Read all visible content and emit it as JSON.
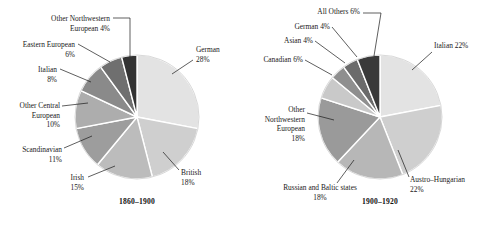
{
  "figure": {
    "type": "pie-pair",
    "background": "#ffffff"
  },
  "chart_data": [
    {
      "type": "pie",
      "title": "1860–1900",
      "caption": "1860–1900",
      "center": [
        137,
        117
      ],
      "radius": 62,
      "start_angle_deg": 0,
      "direction": "clockwise",
      "categories": [
        "German",
        "British",
        "Irish",
        "Scandinavian",
        "Other Central European",
        "Italian",
        "Eastern European",
        "Other Northwestern European"
      ],
      "values": [
        28,
        18,
        15,
        11,
        10,
        8,
        6,
        4
      ],
      "unit": "%",
      "colors": [
        "#e3e3e3",
        "#cfcfcf",
        "#bcbcbc",
        "#9d9d9d",
        "#adadad",
        "#8a8a8a",
        "#6f6f6f",
        "#333333"
      ],
      "slices": [
        {
          "label": "German",
          "value": 28,
          "value_text": "28%",
          "color": "#e3e3e3",
          "label_lines": [
            "German",
            "28%"
          ],
          "label_anchor": "start",
          "label_x": 196,
          "label_y": 52,
          "leader": [
            [
              193,
              60
            ],
            [
              172,
              74
            ]
          ]
        },
        {
          "label": "British",
          "value": 18,
          "value_text": "18%",
          "color": "#cfcfcf",
          "label_lines": [
            "British",
            "18%"
          ],
          "label_anchor": "start",
          "label_x": 181,
          "label_y": 175,
          "leader": [
            [
              179,
              170
            ],
            [
              163,
              152
            ]
          ]
        },
        {
          "label": "Irish",
          "value": 15,
          "value_text": "15%",
          "color": "#bcbcbc",
          "label_lines": [
            "Irish",
            "15%"
          ],
          "label_anchor": "end",
          "label_x": 84,
          "label_y": 180,
          "leader": [
            [
              88,
              177
            ],
            [
              115,
              166
            ]
          ]
        },
        {
          "label": "Scandinavian",
          "value": 11,
          "value_text": "11%",
          "color": "#9d9d9d",
          "label_lines": [
            "Scandinavian",
            "11%"
          ],
          "label_anchor": "end",
          "label_x": 62,
          "label_y": 152,
          "leader": [
            [
              64,
              148
            ],
            [
              92,
              136
            ]
          ]
        },
        {
          "label": "Other Central European",
          "value": 10,
          "value_text": "10%",
          "color": "#adadad",
          "label_lines": [
            "Other Central",
            "European",
            "10%"
          ],
          "label_anchor": "end",
          "label_x": 60,
          "label_y": 108,
          "leader": [
            [
              62,
              106
            ],
            [
              88,
              103
            ]
          ]
        },
        {
          "label": "Italian",
          "value": 8,
          "value_text": "8%",
          "color": "#8a8a8a",
          "label_lines": [
            "Italian",
            "8%"
          ],
          "label_anchor": "end",
          "label_x": 57,
          "label_y": 72,
          "leader": [
            [
              60,
              69
            ],
            [
              91,
              82
            ]
          ]
        },
        {
          "label": "Eastern European",
          "value": 6,
          "value_text": "6%",
          "color": "#6f6f6f",
          "label_lines": [
            "Eastern European",
            "6%"
          ],
          "label_anchor": "end",
          "label_x": 75,
          "label_y": 47,
          "leader": [
            [
              78,
              44
            ],
            [
              110,
              62
            ]
          ]
        },
        {
          "label": "Other Northwestern European",
          "value": 4,
          "value_text": "4%",
          "color": "#333333",
          "label_lines": [
            "Other Northwestern",
            "European 4%"
          ],
          "label_anchor": "end",
          "label_x": 110,
          "label_y": 21,
          "leader": [
            [
              113,
              18
            ],
            [
              130,
              18
            ],
            [
              130,
              57
            ]
          ]
        }
      ]
    },
    {
      "type": "pie",
      "title": "1900–1920",
      "caption": "1900–1920",
      "center": [
        380,
        117
      ],
      "radius": 62,
      "start_angle_deg": 0,
      "direction": "clockwise",
      "categories": [
        "Italian",
        "Austro-Hungarian",
        "Russian and Baltic states",
        "Other Northwestern European",
        "Canadian",
        "Asian",
        "German",
        "All Others"
      ],
      "values": [
        22,
        22,
        18,
        18,
        6,
        4,
        4,
        6
      ],
      "unit": "%",
      "colors": [
        "#e3e3e3",
        "#cfcfcf",
        "#b7b7b7",
        "#9a9a9a",
        "#c9c9c9",
        "#8f8f8f",
        "#6b6b6b",
        "#3a3a3a"
      ],
      "slices": [
        {
          "label": "Italian",
          "value": 22,
          "value_text": "22%",
          "color": "#e3e3e3",
          "label_lines": [
            "Italian 22%"
          ],
          "label_anchor": "start",
          "label_x": 434,
          "label_y": 48,
          "leader": [
            [
              432,
              52
            ],
            [
              412,
              70
            ]
          ]
        },
        {
          "label": "Austro-Hungarian",
          "value": 22,
          "value_text": "22%",
          "color": "#cfcfcf",
          "label_lines": [
            "Austro–Hungarian",
            "22%"
          ],
          "label_anchor": "start",
          "label_x": 410,
          "label_y": 182,
          "leader": [
            [
              409,
              177
            ],
            [
              398,
              150
            ]
          ]
        },
        {
          "label": "Russian and Baltic states",
          "value": 18,
          "value_text": "18%",
          "color": "#b7b7b7",
          "label_lines": [
            "Russian and Baltic states",
            "18%"
          ],
          "label_anchor": "middle",
          "label_x": 320,
          "label_y": 190,
          "leader": [
            [
              337,
              183
            ],
            [
              354,
              160
            ]
          ]
        },
        {
          "label": "Other Northwestern European",
          "value": 18,
          "value_text": "18%",
          "color": "#9a9a9a",
          "label_lines": [
            "Other",
            "Northwestern",
            "European",
            "18%"
          ],
          "label_anchor": "end",
          "label_x": 305,
          "label_y": 112,
          "leader": [
            [
              307,
              113
            ],
            [
              334,
              120
            ]
          ]
        },
        {
          "label": "Canadian",
          "value": 6,
          "value_text": "6%",
          "color": "#c9c9c9",
          "label_lines": [
            "Canadian 6%"
          ],
          "label_anchor": "end",
          "label_x": 303,
          "label_y": 62,
          "leader": [
            [
              305,
              60
            ],
            [
              332,
              75
            ]
          ]
        },
        {
          "label": "Asian",
          "value": 4,
          "value_text": "4%",
          "color": "#8f8f8f",
          "label_lines": [
            "Asian 4%"
          ],
          "label_anchor": "end",
          "label_x": 313,
          "label_y": 43,
          "leader": [
            [
              315,
              41
            ],
            [
              345,
              63
            ]
          ]
        },
        {
          "label": "German",
          "value": 4,
          "value_text": "4%",
          "color": "#6b6b6b",
          "label_lines": [
            "German 4%"
          ],
          "label_anchor": "end",
          "label_x": 330,
          "label_y": 29,
          "leader": [
            [
              332,
              27
            ],
            [
              357,
              57
            ]
          ]
        },
        {
          "label": "All Others",
          "value": 6,
          "value_text": "6%",
          "color": "#3a3a3a",
          "label_lines": [
            "All Others 6%"
          ],
          "label_anchor": "end",
          "label_x": 360,
          "label_y": 14,
          "leader": [
            [
              363,
              13
            ],
            [
              381,
              13
            ],
            [
              374,
              56
            ]
          ]
        }
      ]
    }
  ]
}
